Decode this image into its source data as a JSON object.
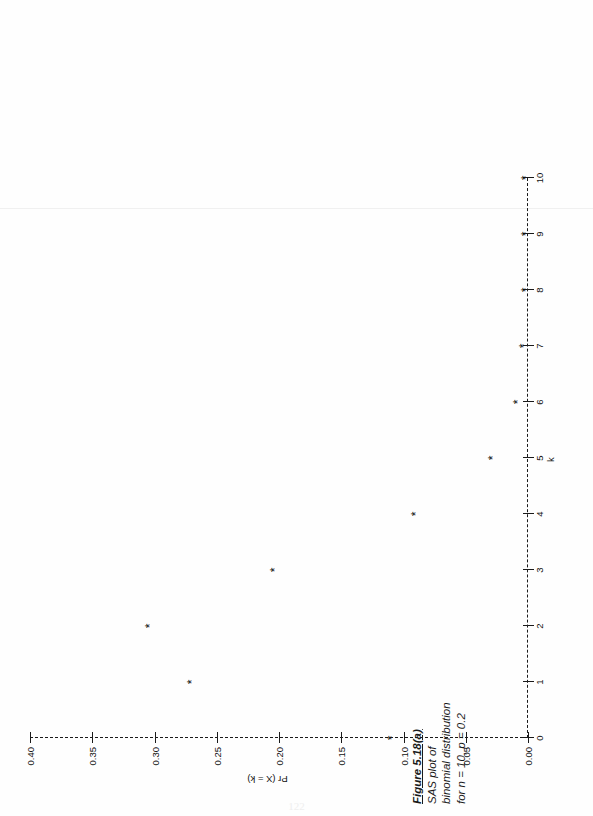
{
  "page": {
    "folio": "122",
    "orientation": "rotated-90",
    "background": "#ffffff"
  },
  "caption": {
    "title": "Figure 5.18(a)",
    "line1": "SAS plot of",
    "line2": "binomial distribution",
    "line3": "for n = 10, p = 0.2"
  },
  "chart_data": {
    "type": "scatter",
    "title": "",
    "xlabel": "k",
    "ylabel": "Pr (X = k)",
    "marker": "*",
    "marker_color": "#0d0d0d",
    "axis_color": "#1a1a1a",
    "grid": false,
    "legend": null,
    "xlim": [
      0,
      10
    ],
    "ylim": [
      0.0,
      0.4
    ],
    "x": [
      0,
      1,
      2,
      3,
      4,
      5,
      6,
      7,
      8,
      9,
      10
    ],
    "values": [
      0.107,
      0.268,
      0.302,
      0.201,
      0.088,
      0.026,
      0.006,
      0.001,
      0.0,
      0.0,
      0.0
    ],
    "categories": [
      "0",
      "1",
      "2",
      "3",
      "4",
      "5",
      "6",
      "7",
      "8",
      "9",
      "10"
    ],
    "xticks": [
      "0",
      "1",
      "2",
      "3",
      "4",
      "5",
      "6",
      "7",
      "8",
      "9",
      "10"
    ],
    "yticks": [
      "0.00",
      "0.05",
      "0.10",
      "0.15",
      "0.20",
      "0.25",
      "0.30",
      "0.35",
      "0.40"
    ],
    "ytick_values": [
      0.0,
      0.05,
      0.1,
      0.15,
      0.2,
      0.25,
      0.3,
      0.35,
      0.4
    ]
  }
}
